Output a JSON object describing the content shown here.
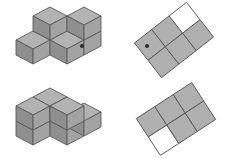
{
  "canvas": {
    "width": 232,
    "height": 158,
    "background": "#ffffff"
  },
  "palette": {
    "cube_top": "#b3b3b3",
    "cube_left": "#8f8f8f",
    "cube_right": "#a3a3a3",
    "cube_outline": "#5a5a5a",
    "tile_fill": "#b0b0b0",
    "tile_empty_fill": "#ffffff",
    "tile_outline": "#5a5a5a",
    "bullet": "#2a2a2a"
  },
  "rows": [
    {
      "id": "row-1",
      "label": "Row 1",
      "iso": {
        "name": "top-left-cube-structure",
        "description": "Isometric stack of unit cubes: an L-shaped base layer with a two-cube tower behind",
        "cube_count": 7,
        "cubes": [
          {
            "x": 0,
            "y": 0,
            "z": 0
          },
          {
            "x": 1,
            "y": 0,
            "z": 0
          },
          {
            "x": 1,
            "y": 1,
            "z": 0
          },
          {
            "x": 0,
            "y": 1,
            "z": 0
          },
          {
            "x": 2,
            "y": 1,
            "z": 0
          },
          {
            "x": 1,
            "y": 1,
            "z": 1
          },
          {
            "x": 2,
            "y": 1,
            "z": 1
          }
        ]
      },
      "grid": {
        "name": "top-right-grid-footprint",
        "description": "Rotated 3 by 2 diamond lattice with the top-right cell left unfilled",
        "rotation_deg": -38,
        "cols": 3,
        "rows": 2,
        "cells": [
          {
            "col": 0,
            "row": 0,
            "filled": true
          },
          {
            "col": 1,
            "row": 0,
            "filled": true
          },
          {
            "col": 2,
            "row": 0,
            "filled": false
          },
          {
            "col": 0,
            "row": 1,
            "filled": true
          },
          {
            "col": 1,
            "row": 1,
            "filled": true
          },
          {
            "col": 2,
            "row": 1,
            "filled": true
          }
        ],
        "filled_count": 5,
        "empty_count": 1
      },
      "bullets": [
        {
          "name": "bullet-separator-left",
          "side": "left"
        },
        {
          "name": "bullet-separator-right",
          "side": "right"
        }
      ]
    },
    {
      "id": "row-2",
      "label": "Row 2",
      "iso": {
        "name": "bottom-left-cube-structure",
        "description": "Isometric stack of unit cubes: a stepped L block, two cubes tall at the back left",
        "cube_count": 8,
        "cubes": [
          {
            "x": 0,
            "y": 0,
            "z": 0
          },
          {
            "x": 1,
            "y": 0,
            "z": 0
          },
          {
            "x": 0,
            "y": 1,
            "z": 0
          },
          {
            "x": 1,
            "y": 1,
            "z": 0
          },
          {
            "x": 2,
            "y": 1,
            "z": 0
          },
          {
            "x": 0,
            "y": 0,
            "z": 1
          },
          {
            "x": 1,
            "y": 0,
            "z": 1
          },
          {
            "x": 0,
            "y": 1,
            "z": 1
          }
        ]
      },
      "grid": {
        "name": "bottom-right-grid-footprint",
        "description": "Rotated 3 by 2 diamond lattice with the bottom-left cell left unfilled",
        "rotation_deg": -38,
        "cols": 3,
        "rows": 2,
        "cells": [
          {
            "col": 0,
            "row": 0,
            "filled": true
          },
          {
            "col": 1,
            "row": 0,
            "filled": true
          },
          {
            "col": 2,
            "row": 0,
            "filled": true
          },
          {
            "col": 0,
            "row": 1,
            "filled": false
          },
          {
            "col": 1,
            "row": 1,
            "filled": true
          },
          {
            "col": 2,
            "row": 1,
            "filled": true
          }
        ],
        "filled_count": 5,
        "empty_count": 1
      },
      "bullets": [
        {
          "name": "bullet-separator-left",
          "side": "left"
        },
        {
          "name": "bullet-separator-right",
          "side": "right"
        }
      ]
    }
  ]
}
